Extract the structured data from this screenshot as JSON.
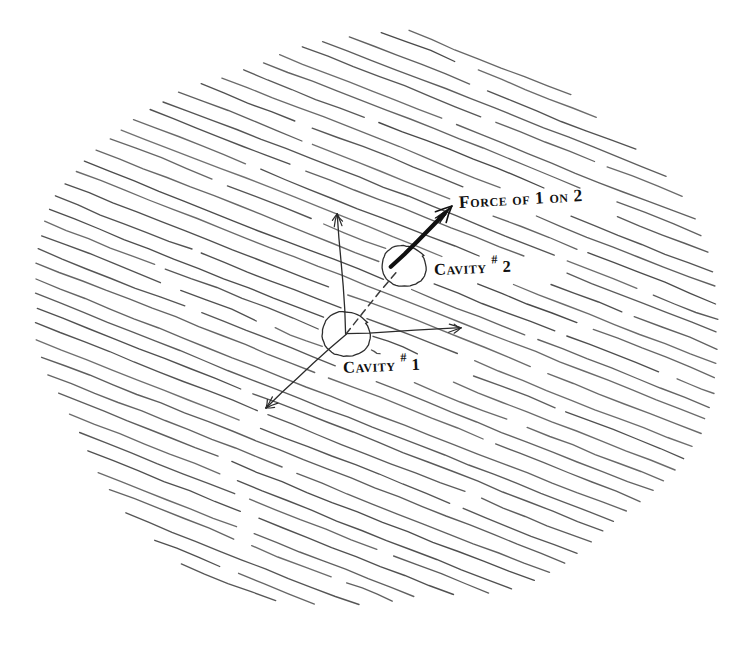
{
  "figure": {
    "kind": "hand-drawn physics diagram",
    "background_color": "#ffffff",
    "ink_color": "#2b2b2b",
    "hatch_color": "#4a4a4a",
    "force_arrow_color": "#101010"
  },
  "labels": {
    "force": {
      "text": "Force of 1 on 2",
      "lead_caps": "F",
      "rest": "orce of 1 on 2",
      "x": 459,
      "y": 194,
      "rotation_deg": -3.2
    },
    "cavity2": {
      "text": "Cavity #2",
      "word": "Cavity",
      "hash": "#",
      "number": "2",
      "x": 434,
      "y": 262,
      "rotation_deg": -2.4
    },
    "cavity1": {
      "text": "Cavity #1",
      "word": "Cavity",
      "hash": "#",
      "number": "1",
      "x": 343,
      "y": 360,
      "rotation_deg": -2.6
    }
  },
  "geometry": {
    "canvas": {
      "width": 741,
      "height": 650
    },
    "medium_blob": {
      "description": "irregular rounded hatched region",
      "center_x": 378,
      "center_y": 322,
      "radius_x": 342,
      "radius_y": 287,
      "hatch_angle_deg": 21.5,
      "hatch_spacing_px": 14.2,
      "line_count": 58
    },
    "cavity1": {
      "cx": 346,
      "cy": 334,
      "r": 23.5,
      "label": "Cavity #1"
    },
    "cavity2": {
      "cx": 404,
      "cy": 266,
      "r": 21.5,
      "label": "Cavity #2"
    },
    "axes_from_cavity1": [
      {
        "name": "vertical-up-axis",
        "x1": 346,
        "y1": 334,
        "x2": 337,
        "y2": 214
      },
      {
        "name": "horizontal-right-axis",
        "x1": 346,
        "y1": 334,
        "x2": 461,
        "y2": 328
      },
      {
        "name": "diagonal-down-left-axis",
        "x1": 346,
        "y1": 334,
        "x2": 266,
        "y2": 408
      }
    ],
    "connector": {
      "name": "cavity1-to-cavity2-dashed-line",
      "x1": 346,
      "y1": 334,
      "x2": 397,
      "y2": 271,
      "style": "dashed"
    },
    "force_vector": {
      "name": "force-of-1-on-2-arrow",
      "x1": 391,
      "y1": 267,
      "x2": 452,
      "y2": 206,
      "angle_deg": 45,
      "style": "bold solid arrow with barbed head"
    }
  }
}
